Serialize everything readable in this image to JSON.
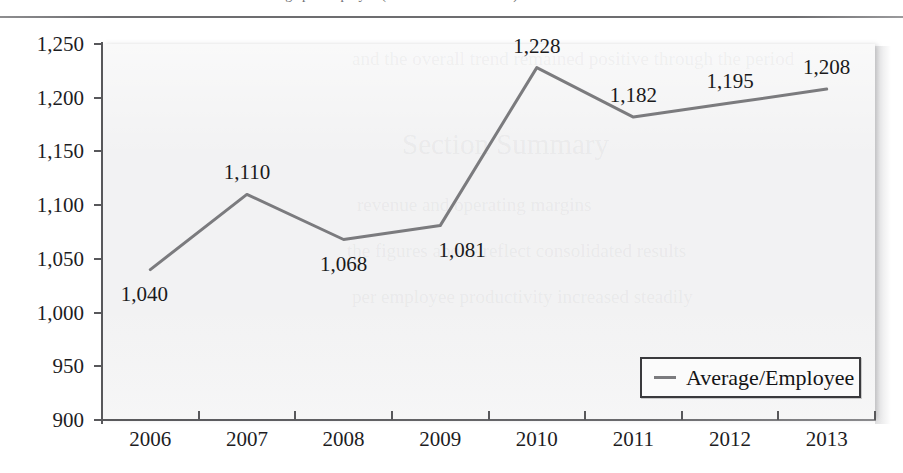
{
  "page": {
    "top_caption_partial": "average per employee (in thousands of dollars)",
    "bleed_through": [
      "and the overall trend remained positive through the period",
      "Section Summary",
      "revenue and operating margins",
      "the figures above reflect consolidated results",
      "per employee productivity increased steadily"
    ]
  },
  "legend": {
    "position": "bottom-right-inside",
    "entries": [
      {
        "label": "Average/Employee",
        "color": "#7b7b7e",
        "marker": "line"
      }
    ]
  },
  "chart_data": {
    "type": "line",
    "title": "",
    "subtitle": "",
    "xlabel": "",
    "ylabel": "",
    "categories": [
      "2006",
      "2007",
      "2008",
      "2009",
      "2010",
      "2011",
      "2012",
      "2013"
    ],
    "series": [
      {
        "name": "Average/Employee",
        "color": "#7b7b7e",
        "values": [
          1040,
          1110,
          1068,
          1081,
          1228,
          1182,
          1195,
          1208
        ],
        "data_labels": [
          "1,040",
          "1,110",
          "1,068",
          "1,081",
          "1,228",
          "1,182",
          "1,195",
          "1,208"
        ],
        "label_positions": [
          "below-left",
          "above",
          "below",
          "below-right",
          "above",
          "above",
          "above",
          "above"
        ]
      }
    ],
    "ylim": [
      900,
      1250
    ],
    "yticks": [
      900,
      950,
      1000,
      1050,
      1100,
      1150,
      1200,
      1250
    ],
    "ytick_labels": [
      "900",
      "950",
      "1,000",
      "1,050",
      "1,100",
      "1,150",
      "1,200",
      "1,250"
    ],
    "grid": false,
    "plot_background": "#f2f2f3",
    "legend_position": "lower right"
  }
}
